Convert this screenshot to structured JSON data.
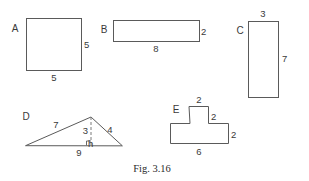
{
  "figure": {
    "caption": "Fig. 3.16",
    "background_color": "#ffffff",
    "stroke_color": "#5a5a5a",
    "text_color": "#3a3a3a"
  },
  "shapes": [
    {
      "letter": "A",
      "name": "square",
      "labels": {
        "right": "5",
        "bottom": "5"
      }
    },
    {
      "letter": "B",
      "name": "rectangle",
      "labels": {
        "right": "2",
        "bottom": "8"
      }
    },
    {
      "letter": "C",
      "name": "rectangle",
      "labels": {
        "top": "3",
        "right": "7"
      }
    },
    {
      "letter": "D",
      "name": "triangle",
      "labels": {
        "left_side": "7",
        "right_side": "4",
        "height": "3",
        "height_foot": "h",
        "base": "9"
      }
    },
    {
      "letter": "E",
      "name": "t-shape",
      "labels": {
        "top": "2",
        "stem_right": "2",
        "bar_right": "2",
        "bottom": "6"
      }
    }
  ]
}
